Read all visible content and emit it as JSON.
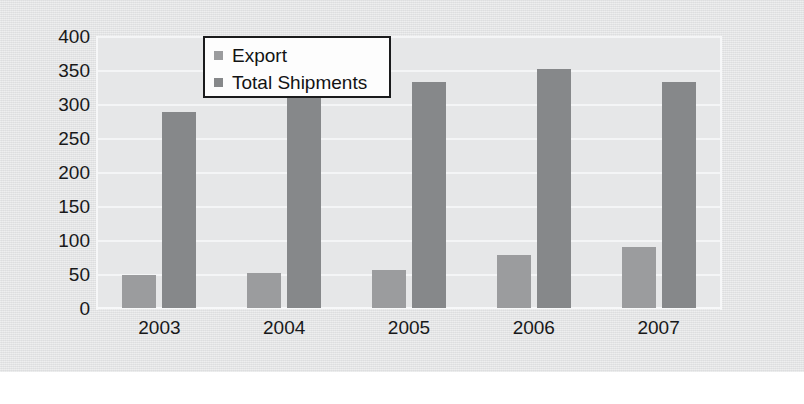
{
  "chart_data": {
    "type": "bar",
    "title": "",
    "xlabel": "",
    "ylabel": "",
    "categories": [
      "2003",
      "2004",
      "2005",
      "2006",
      "2007"
    ],
    "series": [
      {
        "name": "Export",
        "color": "#9b9c9e",
        "values": [
          48,
          52,
          56,
          78,
          90
        ]
      },
      {
        "name": "Total Shipments",
        "color": "#86888a",
        "values": [
          288,
          317,
          333,
          352,
          333
        ]
      }
    ],
    "ylim": [
      0,
      400
    ],
    "yticks": [
      "400",
      "350",
      "300",
      "250",
      "200",
      "150",
      "100",
      "50",
      "0"
    ],
    "ytick_values": [
      400,
      350,
      300,
      250,
      200,
      150,
      100,
      50,
      0
    ],
    "grid": true,
    "legend_position": "top-center"
  },
  "legend": {
    "items": [
      {
        "label": "Export",
        "marker": "square-swatch"
      },
      {
        "label": "Total Shipments",
        "marker": "square-swatch"
      }
    ]
  },
  "colors": {
    "export_bar": "#9b9c9e",
    "total_bar": "#86888a",
    "plot_background": "#e6e7e8",
    "page_background": "#e2e3e4",
    "gridline": "#f4f5f6",
    "text": "#18191a",
    "legend_border": "#1a1b1c"
  }
}
